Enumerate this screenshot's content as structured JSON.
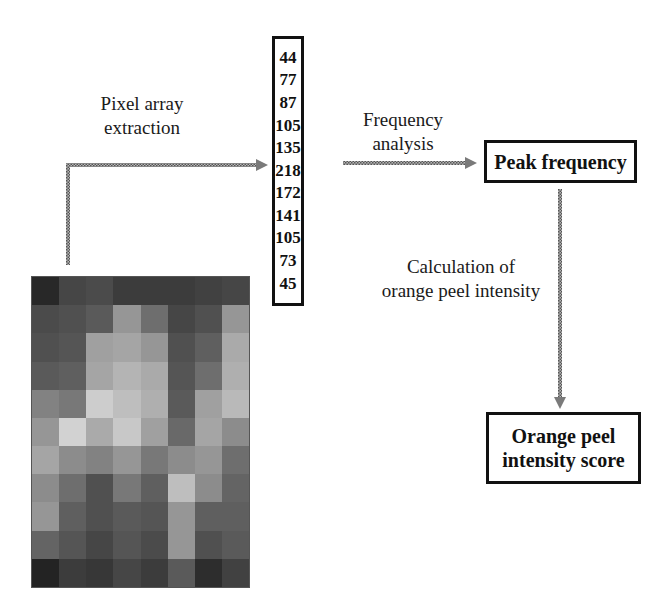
{
  "diagram": {
    "steps": {
      "pixel_extraction_label": [
        "Pixel array",
        "extraction"
      ],
      "frequency_analysis_label": [
        "Frequency",
        "analysis"
      ],
      "calculation_label": [
        "Calculation of",
        "orange peel intensity"
      ]
    },
    "pixel_values": [
      "44",
      "77",
      "87",
      "105",
      "135",
      "218",
      "172",
      "141",
      "105",
      "73",
      "45"
    ],
    "boxes": {
      "peak_frequency": "Peak frequency",
      "score": [
        "Orange peel",
        "intensity score"
      ]
    },
    "pixel_grid": {
      "columns": 8,
      "rows": 11,
      "gray_levels": [
        [
          40,
          70,
          75,
          60,
          60,
          60,
          65,
          70
        ],
        [
          75,
          80,
          90,
          150,
          110,
          70,
          80,
          150
        ],
        [
          80,
          85,
          160,
          165,
          150,
          80,
          95,
          170
        ],
        [
          90,
          95,
          165,
          180,
          170,
          85,
          110,
          175
        ],
        [
          130,
          120,
          205,
          190,
          175,
          90,
          160,
          185
        ],
        [
          150,
          210,
          170,
          200,
          160,
          105,
          165,
          140
        ],
        [
          165,
          140,
          130,
          150,
          120,
          140,
          150,
          110
        ],
        [
          140,
          110,
          80,
          120,
          95,
          190,
          140,
          100
        ],
        [
          150,
          95,
          80,
          90,
          85,
          150,
          95,
          95
        ],
        [
          100,
          85,
          70,
          85,
          75,
          150,
          80,
          90
        ],
        [
          35,
          60,
          55,
          70,
          60,
          90,
          45,
          65
        ]
      ]
    },
    "colors": {
      "arrow": "#8a8a8a",
      "border": "#111111"
    }
  }
}
